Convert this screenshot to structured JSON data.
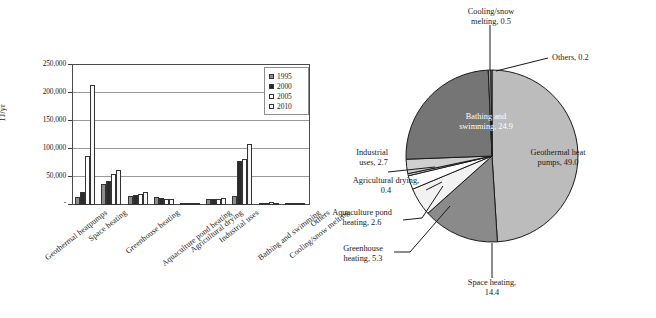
{
  "figure": {
    "panels": [
      "bar",
      "pie"
    ]
  },
  "chart_data": [
    {
      "type": "bar",
      "title": "",
      "xlabel": "",
      "ylabel": "TJ/yr",
      "ylim": [
        0,
        250000
      ],
      "ytick_labels": [
        "250,000",
        "200,000",
        "150,000",
        "100,000",
        "50,000",
        "-"
      ],
      "ytick_values": [
        250000,
        200000,
        150000,
        100000,
        50000,
        0
      ],
      "grid": true,
      "legend_position": "top-right",
      "categories": [
        "Geothermal heatpumps",
        "Space heating",
        "Greenhouse heating",
        "Aquaculture pond heating",
        "Agricultural drying",
        "Industrial uses",
        "Bathing and swimming",
        "Cooling/snow melting",
        "Others"
      ],
      "series": [
        {
          "name": "1995",
          "color": "#8e8e8e",
          "values": [
            14617,
            38230,
            15742,
            13493,
            1124,
            10120,
            15742,
            1124,
            2248
          ]
        },
        {
          "name": "2000",
          "color": "#2b2b2b",
          "values": [
            23275,
            42926,
            17864,
            11733,
            1038,
            10868,
            79430,
            1079,
            1045
          ]
        },
        {
          "name": "2005",
          "color": "#ffffff",
          "values": [
            87503,
            55256,
            19607,
            10976,
            2013,
            11068,
            83018,
            6029,
            1045
          ]
        },
        {
          "name": "2010",
          "color": "#f7f7f7",
          "values": [
            214782,
            62984,
            23264,
            11521,
            1662,
            11746,
            109410,
            2126,
            955
          ]
        }
      ]
    },
    {
      "type": "pie",
      "title": "",
      "unit": "percent",
      "slices": [
        {
          "label": "Geothermal heat pumps",
          "value": 49.0,
          "display": "Geothermal heat pumps, 49.0",
          "color": "#bcbcbc",
          "label_placement": "inside",
          "text_color": "#1a1a1a"
        },
        {
          "label": "Space heating",
          "value": 14.4,
          "display": "Space heating, 14.4",
          "color": "#8a8a8a",
          "label_placement": "outside-leader",
          "text_color": "#1a1a1a"
        },
        {
          "label": "Greenhouse heating",
          "value": 5.3,
          "display": "Greenhouse heating, 5.3",
          "color": "#f2f2f2",
          "label_placement": "outside-leader",
          "text_color": "#1a1a1a"
        },
        {
          "label": "Aquaculture pond heating",
          "value": 2.6,
          "display": "Aquaculture pond heating, 2.6",
          "color": "#ffffff",
          "label_placement": "outside-leader",
          "text_color": "#1a1a1a"
        },
        {
          "label": "Agricultural drying",
          "value": 0.4,
          "display": "Agricultural drying, 0.4",
          "color": "#d9d9d9",
          "label_placement": "outside-leader",
          "text_color": "#1a1a1a"
        },
        {
          "label": "Industrial uses",
          "value": 2.7,
          "display": "Industrial uses, 2.7",
          "color": "#cfcfcf",
          "label_placement": "outside-leader",
          "text_color": "#1a1a1a"
        },
        {
          "label": "Bathing and swimming",
          "value": 24.9,
          "display": "Bathing and swimming, 24.9",
          "color": "#757575",
          "label_placement": "inside",
          "text_color": "#ffffff"
        },
        {
          "label": "Cooling/snow melting",
          "value": 0.5,
          "display": "Cooling/snow melting, 0.5",
          "color": "#9d9d9d",
          "label_placement": "outside-leader",
          "text_color": "#1a1a1a"
        },
        {
          "label": "Others",
          "value": 0.2,
          "display": "Others, 0.2",
          "color": "#b0b0b0",
          "label_placement": "outside-leader",
          "text_color": "#1a1a1a"
        }
      ],
      "labels": {
        "cooling_snow_melting": "Cooling/snow\nmelting, 0.5",
        "cooling_line1": "Cooling/snow",
        "cooling_line2": "melting, 0.5",
        "others": "Others, 0.2",
        "geothermal_line1": "Geothermal heat",
        "geothermal_line2": "pumps, 49.0",
        "bathing_line1": "Bathing and",
        "bathing_line2": "swimming, 24.9",
        "industrial_line1": "Industrial",
        "industrial_line2": "uses, 2.7",
        "agricultural_line1": "Agricultural drying,",
        "agricultural_line2": "0.4",
        "aquaculture_line1": "Aquaculture pond",
        "aquaculture_line2": "heating, 2.6",
        "greenhouse_line1": "Greenhouse",
        "greenhouse_line2": "heating, 5.3",
        "space_line1": "Space heating,",
        "space_line2": "14.4"
      }
    }
  ]
}
